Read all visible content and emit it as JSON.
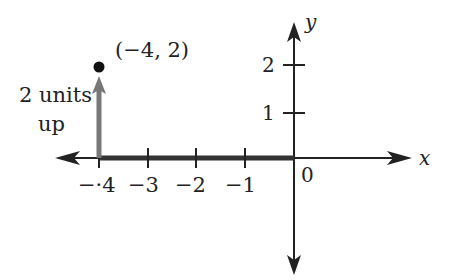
{
  "diagram": {
    "type": "coordinate-plane",
    "axes": {
      "x_label": "x",
      "y_label": "y",
      "origin_label": "0",
      "x_ticks": [
        {
          "value": -4,
          "label": "−·4"
        },
        {
          "value": -3,
          "label": "−3"
        },
        {
          "value": -2,
          "label": "−2"
        },
        {
          "value": -1,
          "label": "−1"
        }
      ],
      "y_ticks": [
        {
          "value": 1,
          "label": "1"
        },
        {
          "value": 2,
          "label": "2"
        }
      ]
    },
    "point": {
      "x": -4,
      "y": 2,
      "label": "(−4, 2)"
    },
    "movement": {
      "horizontal": {
        "from": 0,
        "to": -4
      },
      "vertical": {
        "from": 0,
        "to": 2,
        "label_line1": "2 units",
        "label_line2": "up"
      }
    },
    "colors": {
      "axis": "#222222",
      "highlight_segment": "#333333",
      "up_arrow": "#777777",
      "point": "#111111"
    }
  }
}
